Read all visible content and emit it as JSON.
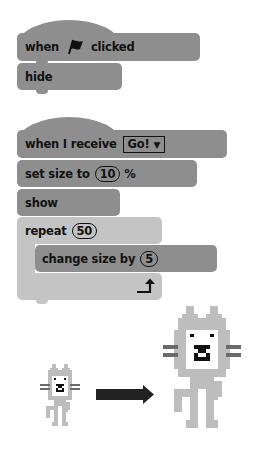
{
  "script1": {
    "hat_when": "when",
    "hat_flag_icon": "green-flag-icon",
    "hat_clicked": "clicked",
    "hide": "hide"
  },
  "script2": {
    "hat_label": "when I receive",
    "message": "Go!",
    "dropdown_arrow": "▼",
    "set_size_label": "set size to",
    "set_size_value": "10",
    "set_size_unit": "%",
    "show": "show",
    "repeat_label": "repeat",
    "repeat_value": "50",
    "change_size_label": "change size by",
    "change_size_value": "5",
    "loop_arrow_icon": "loop-arrow-icon"
  },
  "illustration": {
    "small_cat": "small-cat-sprite",
    "arrow": "right-arrow",
    "big_cat": "big-cat-sprite"
  },
  "colors": {
    "block_dark": "#8e8e8e",
    "block_light": "#c4c4c4",
    "cat_body": "#bdbdbd",
    "cat_face": "#ffffff",
    "whisker": "#6a6a6a",
    "arrow": "#222222"
  }
}
